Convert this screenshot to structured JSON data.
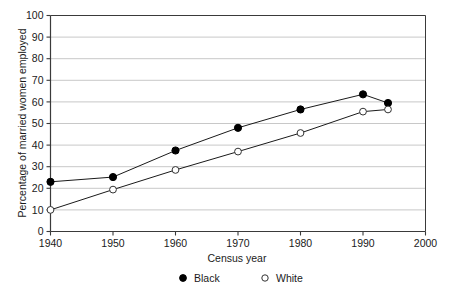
{
  "chart_data": {
    "type": "line",
    "title": "",
    "xlabel": "Census year",
    "ylabel": "Percentage of married women employed",
    "x": [
      1940,
      1950,
      1960,
      1970,
      1980,
      1990,
      1994
    ],
    "xlim": [
      1940,
      2000
    ],
    "ylim": [
      0,
      100
    ],
    "xticks": [
      1940,
      1950,
      1960,
      1970,
      1980,
      1990,
      2000
    ],
    "xtick_labels": [
      "1940",
      "1950",
      "1960",
      "1970",
      "1980",
      "1990",
      "2000"
    ],
    "yticks": [
      0,
      10,
      20,
      30,
      40,
      50,
      60,
      70,
      80,
      90,
      100
    ],
    "ytick_labels": [
      "0",
      "10",
      "20",
      "30",
      "40",
      "50",
      "60",
      "70",
      "80",
      "90",
      "100"
    ],
    "grid": "horizontal",
    "legend_position": "below-plot",
    "series": [
      {
        "name": "Black",
        "marker": "filled-circle",
        "color": "#000000",
        "values": [
          23,
          25.2,
          37.5,
          48,
          56.5,
          63.5,
          59.5
        ]
      },
      {
        "name": "White",
        "marker": "open-circle",
        "color": "#000000",
        "values": [
          10,
          19.4,
          28.5,
          37,
          45.6,
          55.5,
          56.5
        ]
      }
    ]
  },
  "legend": {
    "items": [
      {
        "label": "Black",
        "marker": "filled-circle"
      },
      {
        "label": "White",
        "marker": "open-circle"
      }
    ]
  },
  "colors": {
    "axis": "#3a3a3a",
    "grid": "#c8c8c8",
    "series_line": "#1a1a1a",
    "marker_fill_black": "#000000",
    "marker_fill_white": "#ffffff",
    "background": "#ffffff"
  }
}
